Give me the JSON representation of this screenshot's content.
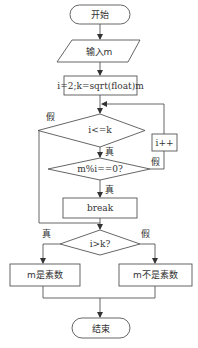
{
  "flowchart": {
    "start": "开始",
    "input": "输入m",
    "init": "i=2;k=sqrt(float)m",
    "cond1": "i<=k",
    "cond1_false": "假",
    "cond1_true": "真",
    "cond2": "m%i==0?",
    "cond2_true": "真",
    "cond2_false": "假",
    "increment": "i++",
    "break": "break",
    "cond3": "i>k?",
    "cond3_true": "真",
    "cond3_false": "假",
    "result_prime": "m是素数",
    "result_not_prime": "m不是素数",
    "end": "结束"
  }
}
